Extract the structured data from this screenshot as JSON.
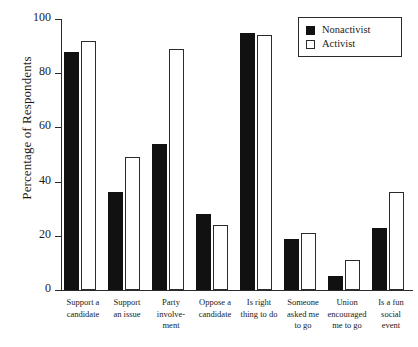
{
  "chart_data": {
    "type": "bar",
    "title": "",
    "xlabel": "",
    "ylabel": "Percentage of Respondents",
    "ylim": [
      0,
      100
    ],
    "yticks": [
      "0",
      "20",
      "40",
      "60",
      "80",
      "100"
    ],
    "grid": false,
    "legend_position": "top-right",
    "categories": [
      "Support a candidate",
      "Support an issue",
      "Party involve-ment",
      "Oppose a candidate",
      "Is right thing to do",
      "Someone asked me to go",
      "Union encouraged me to go",
      "Is a fun social event"
    ],
    "category_lines": [
      [
        "Support a",
        "candidate"
      ],
      [
        "Support",
        "an issue"
      ],
      [
        "Party",
        "involve-",
        "ment"
      ],
      [
        "Oppose a",
        "candidate"
      ],
      [
        "Is right",
        "thing to do"
      ],
      [
        "Someone",
        "asked me",
        "to go"
      ],
      [
        "Union",
        "encouraged",
        "me to go"
      ],
      [
        "Is a fun",
        "social",
        "event"
      ]
    ],
    "series": [
      {
        "name": "Nonactivist",
        "color": "#111111",
        "values": [
          88,
          36,
          54,
          28,
          95,
          19,
          5,
          23
        ]
      },
      {
        "name": "Activist",
        "color": "#ffffff",
        "values": [
          92,
          49,
          89,
          24,
          94,
          21,
          11,
          36
        ]
      }
    ]
  },
  "legend": {
    "items": [
      {
        "label": "Nonactivist",
        "swatch": "filled-square"
      },
      {
        "label": "Activist",
        "swatch": "open-square"
      }
    ]
  },
  "caption": {
    "stub": ""
  }
}
